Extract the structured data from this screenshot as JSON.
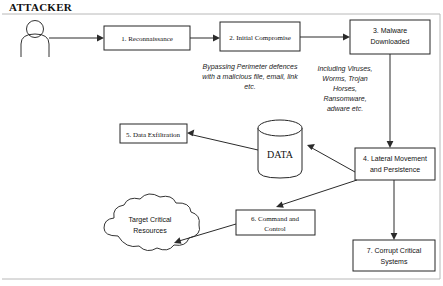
{
  "diagram": {
    "actor_label": "ATTACKER",
    "nodes": {
      "recon": {
        "label": "1. Reconnaissance"
      },
      "initial_compromise": {
        "label": "2. Initial Compromise"
      },
      "malware_line1": {
        "label": "3. Malware"
      },
      "malware_line2": {
        "label": "Downloaded"
      },
      "data_store": {
        "label": "DATA"
      },
      "exfiltration": {
        "label": "5. Data Exfiltration"
      },
      "lateral_line1": {
        "label": "4. Lateral Movement"
      },
      "lateral_line2": {
        "label": "and Persistence"
      },
      "command_line1": {
        "label": "6. Command and"
      },
      "command_line2": {
        "label": "Control"
      },
      "target_line1": {
        "label": "Target Critical"
      },
      "target_line2": {
        "label": "Resources"
      },
      "corrupt_line1": {
        "label": "7. Corrupt Critical"
      },
      "corrupt_line2": {
        "label": "Systems"
      }
    },
    "annotations": {
      "initial_compromise_note": [
        "Bypassing Perimeter defences",
        "with a malicious file, email, link",
        "etc."
      ],
      "malware_note": [
        "Including Viruses,",
        "Worms, Trojan",
        "Horses,",
        "Ransomware,",
        "adware etc."
      ]
    },
    "colors": {
      "stroke": "#262626",
      "connector": "#2b2b2b",
      "text": "#111111",
      "background": "#ffffff",
      "frame": "#b8b8b8"
    }
  }
}
